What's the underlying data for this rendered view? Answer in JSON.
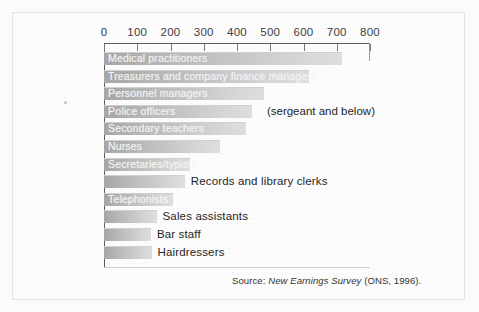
{
  "figure": {
    "source_note_prefix": "Source: ",
    "source_note_italic": "New Earnings Survey",
    "source_note_suffix": " (ONS, 1996)."
  },
  "chart_data": {
    "type": "bar",
    "orientation": "horizontal",
    "title": "",
    "subtitle": "",
    "xlabel": "",
    "ylabel": "",
    "xlim": [
      0,
      800
    ],
    "xticks": [
      0,
      100,
      200,
      300,
      400,
      500,
      600,
      700,
      800
    ],
    "xticklabels": [
      "0",
      "100",
      "200",
      "300",
      "400",
      "500",
      "600",
      "700",
      "800"
    ],
    "grid": false,
    "legend": null,
    "categories": [
      "Medical practitioners",
      "Treasurers and company finance managers",
      "Personnel managers",
      "Police officers",
      "Secondary teachers",
      "Nurses",
      "Secretaries/typists",
      "Records and library clerks",
      "Telephonists",
      "Sales assistants",
      "Bar staff",
      "Hairdressers"
    ],
    "values": [
      715,
      618,
      482,
      445,
      427,
      348,
      260,
      243,
      208,
      158,
      141,
      143
    ],
    "label_placement": [
      "inside",
      "inside",
      "inside",
      "inside",
      "inside",
      "inside",
      "inside",
      "outside",
      "inside",
      "outside",
      "outside",
      "outside"
    ],
    "annotations": [
      {
        "text": "(sergeant and below)",
        "category": "Police officers",
        "x": 490
      }
    ],
    "bar_color_start": "#a5a5a5",
    "bar_color_end": "#dedede",
    "axis_color": "#5d5d5d",
    "text_color": "#262626",
    "inside_label_color": "#f2f2f2"
  }
}
